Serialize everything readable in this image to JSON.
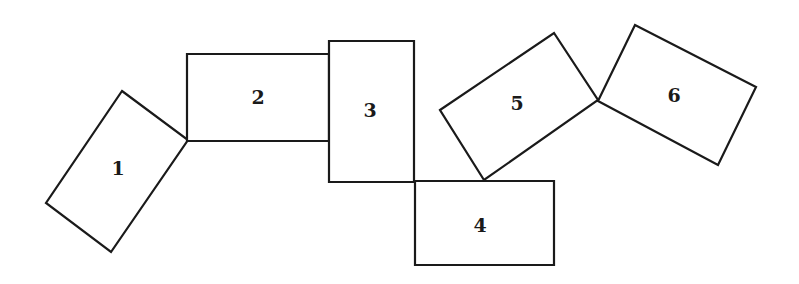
{
  "diagram": {
    "stroke_color": "#1a1a1a",
    "background": "#ffffff",
    "rectangles": [
      {
        "label": "1",
        "points": "122,91 188,140 111,252 46,203",
        "label_pos": [
          118,
          168
        ]
      },
      {
        "label": "2",
        "points": "187,54 329,54 329,141 187,141",
        "label_pos": [
          258,
          97
        ]
      },
      {
        "label": "3",
        "points": "329,41 414,41 414,182 329,182",
        "label_pos": [
          370,
          110
        ]
      },
      {
        "label": "4",
        "points": "415,181 554,181 554,265 415,265",
        "label_pos": [
          480,
          225
        ]
      },
      {
        "label": "5",
        "points": "440,110 554,33 598,100 484,180",
        "label_pos": [
          517,
          103
        ]
      },
      {
        "label": "6",
        "points": "598,101 635,25 756,87 718,165",
        "label_pos": [
          674,
          95
        ]
      }
    ]
  }
}
